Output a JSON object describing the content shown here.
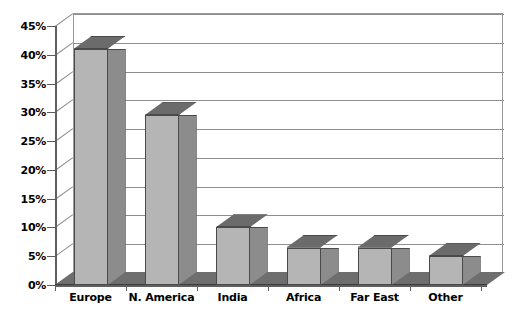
{
  "chart_data": {
    "type": "bar",
    "title": "",
    "subtitle": "",
    "xlabel": "",
    "ylabel": "",
    "categories": [
      "Europe",
      "N. America",
      "India",
      "Africa",
      "Far East",
      "Other"
    ],
    "values": [
      41,
      29.5,
      10,
      6.5,
      6.5,
      5
    ],
    "value_labels": [
      "41%",
      "29.5%",
      "10%",
      "6.5%",
      "6.5%",
      "5%"
    ],
    "ylim": [
      0,
      45
    ],
    "ytick_values": [
      0,
      5,
      10,
      15,
      20,
      25,
      30,
      35,
      40,
      45
    ],
    "ytick_labels": [
      "0%",
      "5%",
      "10%",
      "15%",
      "20%",
      "25%",
      "30%",
      "35%",
      "40%",
      "45%"
    ],
    "grid": true,
    "grid_axis": "y",
    "legend": false,
    "legend_position": "none",
    "style": "3d-column",
    "annotations": []
  },
  "colors": {
    "bar_front": "#b5b5b5",
    "bar_side": "#8c8c8c",
    "bar_top": "#6b6b6b",
    "bar_outline": "#4a4a4a",
    "gridline": "#8e8e8e",
    "axis": "#5f5f5f",
    "floor": "#6e6e6e",
    "plot_background": "#ffffff",
    "text": "#000000"
  },
  "caption": {
    "ghost_text": ""
  }
}
